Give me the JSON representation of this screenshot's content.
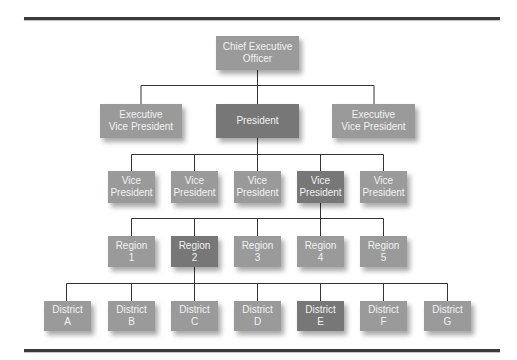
{
  "chart_title": "Organization chart",
  "colors": {
    "node_light": "#9a9a9a",
    "node_dark": "#777777",
    "text": "#f2f2f2",
    "line": "#3a3a3a"
  },
  "levels": [
    {
      "name": "ceo",
      "nodes": [
        {
          "id": "ceo",
          "label": "Chief Executive\nOfficer",
          "shade": "light"
        }
      ]
    },
    {
      "name": "executives",
      "nodes": [
        {
          "id": "evp-left",
          "label": "Executive\nVice President",
          "shade": "light",
          "parent": "ceo"
        },
        {
          "id": "president",
          "label": "President",
          "shade": "dark",
          "parent": "ceo"
        },
        {
          "id": "evp-right",
          "label": "Executive\nVice President",
          "shade": "light",
          "parent": "ceo"
        }
      ]
    },
    {
      "name": "vice-presidents",
      "nodes": [
        {
          "id": "vp-1",
          "label": "Vice\nPresident",
          "shade": "light",
          "parent": "president"
        },
        {
          "id": "vp-2",
          "label": "Vice\nPresident",
          "shade": "light",
          "parent": "president"
        },
        {
          "id": "vp-3",
          "label": "Vice\nPresident",
          "shade": "light",
          "parent": "president"
        },
        {
          "id": "vp-4",
          "label": "Vice\nPresident",
          "shade": "dark",
          "parent": "president"
        },
        {
          "id": "vp-5",
          "label": "Vice\nPresident",
          "shade": "light",
          "parent": "president"
        }
      ]
    },
    {
      "name": "regions",
      "nodes": [
        {
          "id": "region-1",
          "label": "Region\n1",
          "shade": "light",
          "parent": "vp-4"
        },
        {
          "id": "region-2",
          "label": "Region\n2",
          "shade": "dark",
          "parent": "vp-4"
        },
        {
          "id": "region-3",
          "label": "Region\n3",
          "shade": "light",
          "parent": "vp-4"
        },
        {
          "id": "region-4",
          "label": "Region\n4",
          "shade": "light",
          "parent": "vp-4"
        },
        {
          "id": "region-5",
          "label": "Region\n5",
          "shade": "light",
          "parent": "vp-4"
        }
      ]
    },
    {
      "name": "districts",
      "nodes": [
        {
          "id": "district-a",
          "label": "District\nA",
          "shade": "light",
          "parent": "region-2"
        },
        {
          "id": "district-b",
          "label": "District\nB",
          "shade": "light",
          "parent": "region-2"
        },
        {
          "id": "district-c",
          "label": "District\nC",
          "shade": "light",
          "parent": "region-2"
        },
        {
          "id": "district-d",
          "label": "District\nD",
          "shade": "light",
          "parent": "region-2"
        },
        {
          "id": "district-e",
          "label": "District\nE",
          "shade": "dark",
          "parent": "region-2"
        },
        {
          "id": "district-f",
          "label": "District\nF",
          "shade": "light",
          "parent": "region-2"
        },
        {
          "id": "district-g",
          "label": "District\nG",
          "shade": "light",
          "parent": "region-2"
        }
      ]
    }
  ]
}
